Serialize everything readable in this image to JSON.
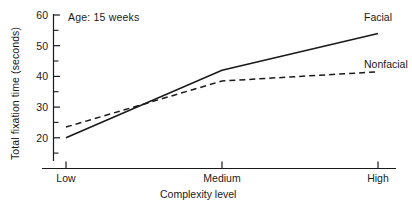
{
  "chart_data": {
    "type": "line",
    "title": "",
    "annotation": "Age: 15 weeks",
    "xlabel": "Complexity level",
    "ylabel": "Total fixation time (seconds)",
    "categories": [
      "Low",
      "Medium",
      "High"
    ],
    "x": [
      0,
      1,
      2
    ],
    "xlim": [
      0,
      2
    ],
    "ylim": [
      17,
      61
    ],
    "yticks": [
      20,
      30,
      40,
      50,
      60
    ],
    "ytick_labels": [
      "20",
      "30",
      "40",
      "50",
      "60"
    ],
    "y_minor_ticks": [
      25,
      35,
      45,
      55
    ],
    "grid": false,
    "legend_position": "right-inline",
    "series": [
      {
        "name": "Facial",
        "style": "solid",
        "color": "#1a1a1a",
        "values": [
          20.0,
          42.0,
          54.0
        ]
      },
      {
        "name": "Nonfacial",
        "style": "dashed",
        "color": "#1a1a1a",
        "values": [
          23.5,
          38.5,
          41.5
        ]
      }
    ]
  },
  "axes": {
    "y_title": "Total fixation time (seconds)",
    "x_title": "Complexity level",
    "y_tick_60": "60",
    "y_tick_50": "50",
    "y_tick_40": "40",
    "y_tick_30": "30",
    "y_tick_20": "20",
    "x_tick_low": "Low",
    "x_tick_medium": "Medium",
    "x_tick_high": "High"
  },
  "labels": {
    "annotation": "Age: 15 weeks",
    "series_facial": "Facial",
    "series_nonfacial": "Nonfacial"
  },
  "colors": {
    "ink": "#1a1a1a",
    "background": "#ffffff"
  }
}
